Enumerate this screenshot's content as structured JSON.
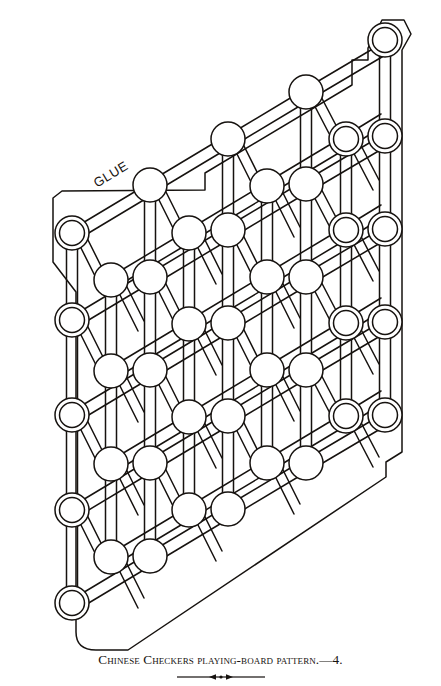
{
  "page": {
    "background_color": "#ffffff",
    "ink_color": "#16120f",
    "width": 441,
    "height": 686
  },
  "figure": {
    "name": "chinese-checkers-board-pattern",
    "annotation_label": "GLUE",
    "annotation_rotation_deg": -31,
    "line_color": "#16120f",
    "stroke_width": 1.5,
    "hole_outer_radius": 17,
    "hole_inner_radius": 12.5,
    "channel_half_width": 5.5,
    "lattice": {
      "origin_x": 72,
      "origin_y": 233,
      "col_step_x": 78,
      "col_step_y": -47,
      "row_step_y": 95,
      "rows": 5,
      "cols": 4
    },
    "holes": [
      {
        "id": "r0c0",
        "cx": 72,
        "cy": 233,
        "double_ring": true
      },
      {
        "id": "r0c1",
        "cx": 150,
        "cy": 185,
        "double_ring": false
      },
      {
        "id": "r0c2",
        "cx": 228,
        "cy": 139,
        "double_ring": false
      },
      {
        "id": "r0c3",
        "cx": 306,
        "cy": 92,
        "double_ring": false
      },
      {
        "id": "r0c4",
        "cx": 385,
        "cy": 40,
        "double_ring": true
      },
      {
        "id": "r1c0",
        "cx": 111,
        "cy": 280,
        "double_ring": false
      },
      {
        "id": "r1c1",
        "cx": 189,
        "cy": 233,
        "double_ring": false
      },
      {
        "id": "r1c2",
        "cx": 267,
        "cy": 186,
        "double_ring": false
      },
      {
        "id": "r1c3",
        "cx": 346,
        "cy": 139,
        "double_ring": true
      },
      {
        "id": "r2c0",
        "cx": 72,
        "cy": 320,
        "double_ring": true
      },
      {
        "id": "r2c1",
        "cx": 150,
        "cy": 277,
        "double_ring": false
      },
      {
        "id": "r2c2",
        "cx": 228,
        "cy": 230,
        "double_ring": false
      },
      {
        "id": "r2c3",
        "cx": 306,
        "cy": 184,
        "double_ring": false
      },
      {
        "id": "r2c4",
        "cx": 385,
        "cy": 136,
        "double_ring": true
      },
      {
        "id": "r3c0",
        "cx": 111,
        "cy": 371,
        "double_ring": false
      },
      {
        "id": "r3c1",
        "cx": 189,
        "cy": 324,
        "double_ring": false
      },
      {
        "id": "r3c2",
        "cx": 267,
        "cy": 277,
        "double_ring": false
      },
      {
        "id": "r3c3",
        "cx": 346,
        "cy": 230,
        "double_ring": true
      },
      {
        "id": "r4c0",
        "cx": 72,
        "cy": 415,
        "double_ring": true
      },
      {
        "id": "r4c1",
        "cx": 150,
        "cy": 370,
        "double_ring": false
      },
      {
        "id": "r4c2",
        "cx": 228,
        "cy": 323,
        "double_ring": false
      },
      {
        "id": "r4c3",
        "cx": 306,
        "cy": 277,
        "double_ring": false
      },
      {
        "id": "r4c4",
        "cx": 385,
        "cy": 229,
        "double_ring": true
      },
      {
        "id": "r5c0",
        "cx": 111,
        "cy": 464,
        "double_ring": false
      },
      {
        "id": "r5c1",
        "cx": 189,
        "cy": 417,
        "double_ring": false
      },
      {
        "id": "r5c2",
        "cx": 267,
        "cy": 370,
        "double_ring": false
      },
      {
        "id": "r5c3",
        "cx": 346,
        "cy": 323,
        "double_ring": true
      },
      {
        "id": "r6c0",
        "cx": 72,
        "cy": 510,
        "double_ring": true
      },
      {
        "id": "r6c1",
        "cx": 150,
        "cy": 463,
        "double_ring": false
      },
      {
        "id": "r6c2",
        "cx": 228,
        "cy": 416,
        "double_ring": false
      },
      {
        "id": "r6c3",
        "cx": 306,
        "cy": 370,
        "double_ring": false
      },
      {
        "id": "r6c4",
        "cx": 385,
        "cy": 322,
        "double_ring": true
      },
      {
        "id": "r7c0",
        "cx": 111,
        "cy": 557,
        "double_ring": false
      },
      {
        "id": "r7c1",
        "cx": 189,
        "cy": 510,
        "double_ring": false
      },
      {
        "id": "r7c2",
        "cx": 267,
        "cy": 463,
        "double_ring": false
      },
      {
        "id": "r7c3",
        "cx": 346,
        "cy": 416,
        "double_ring": true
      },
      {
        "id": "r8c0",
        "cx": 72,
        "cy": 603,
        "double_ring": true
      },
      {
        "id": "r8c1",
        "cx": 150,
        "cy": 556,
        "double_ring": false
      },
      {
        "id": "r8c2",
        "cx": 228,
        "cy": 509,
        "double_ring": false
      },
      {
        "id": "r8c3",
        "cx": 306,
        "cy": 463,
        "double_ring": false
      },
      {
        "id": "r8c4",
        "cx": 385,
        "cy": 415,
        "double_ring": true
      }
    ],
    "outline_points": "206,188 206,172 389,60 389,19 415,19 415,48 409,58 409,446 385,455 385,470 120,652 95,652 78,638 78,290 53,258 53,196"
  },
  "caption": {
    "text": "Chinese Checkers playing-board pattern.—4."
  },
  "ornament": {
    "name": "rule-ornament",
    "width": 88
  }
}
